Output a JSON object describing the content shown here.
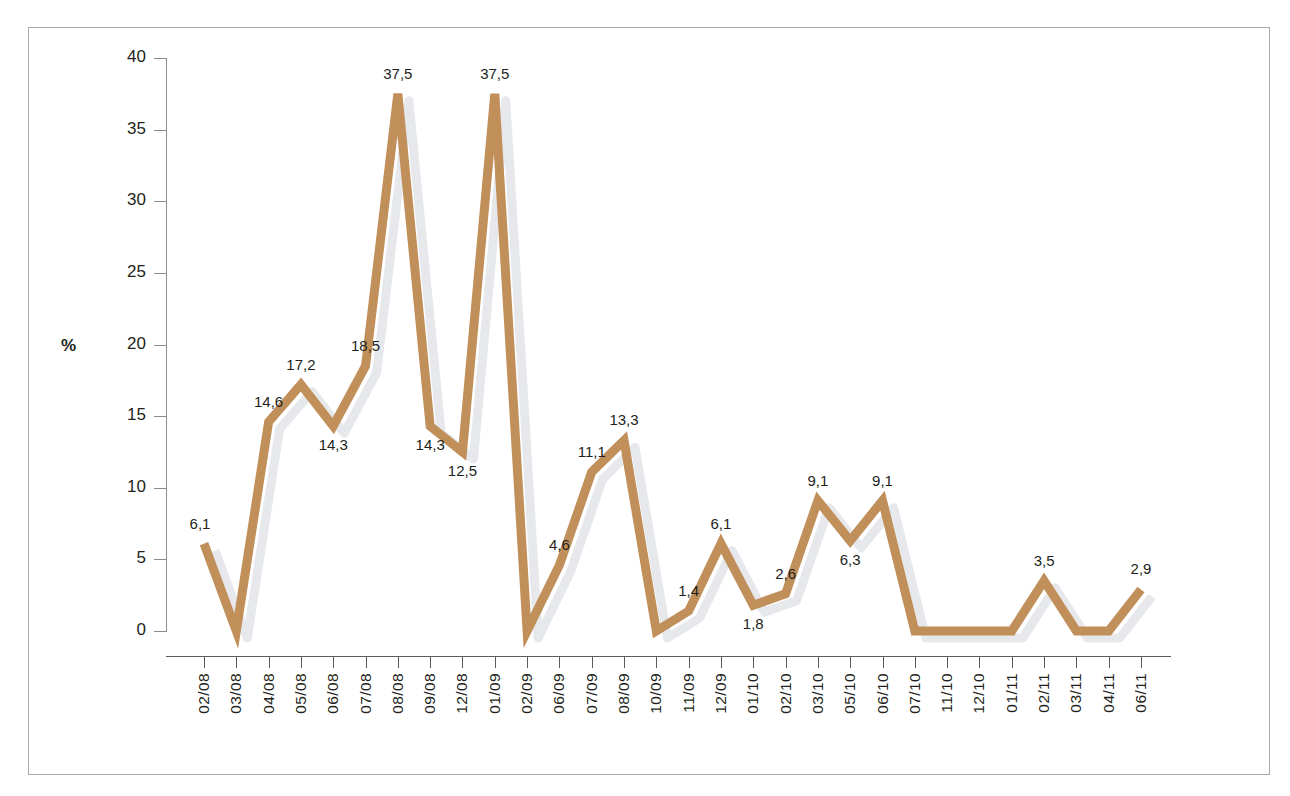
{
  "chart_data": {
    "type": "line",
    "title": "",
    "subtitle": "",
    "xlabel": "",
    "ylabel": "%",
    "ylim": [
      0,
      40
    ],
    "yticks": [
      0,
      5,
      10,
      15,
      20,
      25,
      30,
      35,
      40
    ],
    "ytick_labels": [
      "0",
      "5",
      "10",
      "15",
      "20",
      "25",
      "30",
      "35",
      "40"
    ],
    "grid": false,
    "legend": null,
    "decimal_separator": ",",
    "line_color": "#c08f5a",
    "shadow_color": "#e6e8ec",
    "categories": [
      "02/08",
      "03/08",
      "04/08",
      "05/08",
      "06/08",
      "07/08",
      "08/08",
      "09/08",
      "12/08",
      "01/09",
      "02/09",
      "06/09",
      "07/09",
      "08/09",
      "10/09",
      "11/09",
      "12/09",
      "01/10",
      "02/10",
      "03/10",
      "05/10",
      "06/10",
      "07/10",
      "11/10",
      "12/10",
      "01/11",
      "02/11",
      "03/11",
      "04/11",
      "06/11"
    ],
    "values": [
      6.1,
      0,
      14.6,
      17.2,
      14.3,
      18.5,
      37.5,
      14.3,
      12.5,
      37.5,
      0,
      4.6,
      11.1,
      13.3,
      0,
      1.4,
      6.1,
      1.8,
      2.6,
      9.1,
      6.3,
      9.1,
      0,
      0,
      0,
      0,
      3.5,
      0,
      0,
      2.9
    ],
    "point_labels": [
      "6,1",
      "",
      "14,6",
      "17,2",
      "14,3",
      "18,5",
      "37,5",
      "14,3",
      "12,5",
      "37,5",
      "",
      "4,6",
      "11,1",
      "13,3",
      "",
      "1,4",
      "6,1",
      "1,8",
      "2,6",
      "9,1",
      "6,3",
      "9,1",
      "",
      "",
      "",
      "",
      "3,5",
      "",
      "",
      "2,9"
    ],
    "label_positions": [
      "above",
      "none",
      "above",
      "above",
      "below",
      "above",
      "above",
      "below",
      "below",
      "above",
      "none",
      "above",
      "above",
      "above",
      "none",
      "above",
      "above",
      "below",
      "above",
      "above",
      "below",
      "above",
      "none",
      "none",
      "none",
      "none",
      "above",
      "none",
      "none",
      "above"
    ]
  }
}
